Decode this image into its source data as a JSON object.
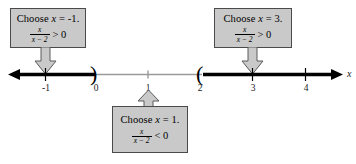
{
  "figure": {
    "axis_label": "x",
    "colors": {
      "box_fill": "#c9c9c9",
      "box_border": "#4a4a4a",
      "solid_ray": "#000000",
      "open_segment": "#9a9a9a",
      "connector_fill": "#c9c9c9",
      "connector_border": "#5a5a5a"
    }
  },
  "number_line": {
    "ticks": [
      {
        "label": "-1",
        "value": -1
      },
      {
        "label": "0",
        "value": 0
      },
      {
        "label": "1",
        "value": 1
      },
      {
        "label": "2",
        "value": 2
      },
      {
        "label": "3",
        "value": 3
      },
      {
        "label": "4",
        "value": 4
      }
    ],
    "endpoints": [
      {
        "symbol": ")",
        "at_value": 0,
        "type": "open"
      },
      {
        "symbol": "(",
        "at_value": 2,
        "type": "open"
      }
    ],
    "shaded_intervals": [
      {
        "from": "-infinity",
        "to": 0,
        "style": "solid-thick",
        "sign": "positive"
      },
      {
        "from": 0,
        "to": 2,
        "style": "thin-gray",
        "sign": "negative"
      },
      {
        "from": 2,
        "to": "+infinity",
        "style": "solid-thick",
        "sign": "positive"
      }
    ],
    "arrow_left": true,
    "arrow_right": true
  },
  "callouts": [
    {
      "id": "left",
      "headline_prefix": "Choose ",
      "headline_var": "x",
      "headline_suffix": " = -1.",
      "numerator": "x",
      "denominator": "x − 2",
      "relation": "> 0",
      "points_to_value": -1,
      "arrow_direction": "down"
    },
    {
      "id": "right",
      "headline_prefix": "Choose ",
      "headline_var": "x",
      "headline_suffix": " = 3.",
      "numerator": "x",
      "denominator": "x − 2",
      "relation": "> 0",
      "points_to_value": 3,
      "arrow_direction": "down"
    },
    {
      "id": "bottom",
      "headline_prefix": "Choose ",
      "headline_var": "x",
      "headline_suffix": " = 1.",
      "numerator": "x",
      "denominator": "x − 2",
      "relation": "< 0",
      "points_to_value": 1,
      "arrow_direction": "up"
    }
  ]
}
